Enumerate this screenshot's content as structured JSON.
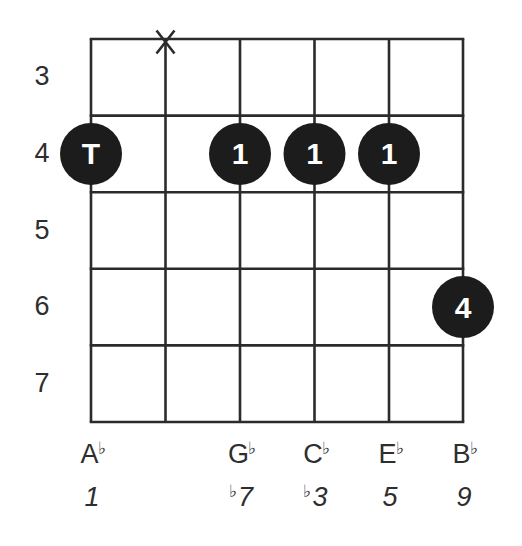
{
  "chart_data": {
    "type": "chord-diagram",
    "instrument": "guitar",
    "strings": 6,
    "fret_labels": [
      "3",
      "4",
      "5",
      "6",
      "7"
    ],
    "muted_strings": [
      2
    ],
    "markers": [
      {
        "string": 1,
        "fret": 4,
        "label": "T"
      },
      {
        "string": 3,
        "fret": 4,
        "label": "1"
      },
      {
        "string": 4,
        "fret": 4,
        "label": "1"
      },
      {
        "string": 5,
        "fret": 4,
        "label": "1"
      },
      {
        "string": 6,
        "fret": 6,
        "label": "4"
      }
    ],
    "notes": [
      {
        "string": 1,
        "letter": "A",
        "accidental": "♭"
      },
      {
        "string": 3,
        "letter": "G",
        "accidental": "♭"
      },
      {
        "string": 4,
        "letter": "C",
        "accidental": "♭"
      },
      {
        "string": 5,
        "letter": "E",
        "accidental": "♭"
      },
      {
        "string": 6,
        "letter": "B",
        "accidental": "♭"
      }
    ],
    "intervals": [
      {
        "string": 1,
        "accidental": "",
        "degree": "1"
      },
      {
        "string": 3,
        "accidental": "♭",
        "degree": "7"
      },
      {
        "string": 4,
        "accidental": "♭",
        "degree": "3"
      },
      {
        "string": 5,
        "accidental": "",
        "degree": "5"
      },
      {
        "string": 6,
        "accidental": "",
        "degree": "9"
      }
    ],
    "mute_symbol": "X"
  },
  "colors": {
    "grid": "#2b2b2b",
    "dot": "#1c1c1c",
    "dot_text": "#ffffff",
    "label": "#2e2e2e"
  }
}
